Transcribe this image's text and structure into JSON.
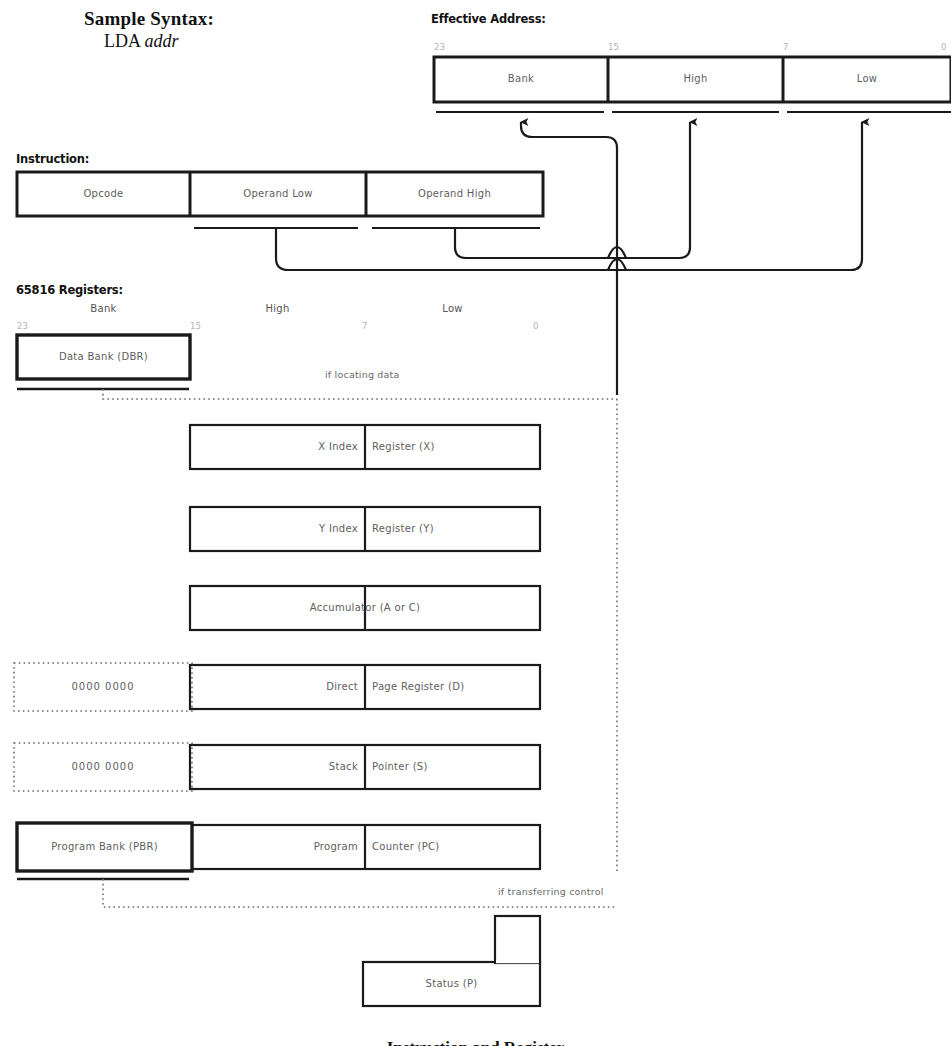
{
  "figure": {
    "caption": "Instruction and Register",
    "sample_syntax": {
      "heading": "Sample Syntax:",
      "mnemonic": "LDA",
      "operand": "addr"
    },
    "effective_address": {
      "heading": "Effective Address:",
      "cells": [
        {
          "label": "Bank"
        },
        {
          "label": "High"
        },
        {
          "label": "Low"
        }
      ],
      "bits": [
        "23",
        "15",
        "7",
        "0"
      ]
    },
    "instruction": {
      "heading": "Instruction:",
      "cells": [
        {
          "label": "Opcode"
        },
        {
          "label": "Operand Low"
        },
        {
          "label": "Operand High"
        }
      ]
    },
    "registers": {
      "heading": "65816 Registers:",
      "column_headers": [
        "Bank",
        "High",
        "Low"
      ],
      "bits": [
        "23",
        "15",
        "7",
        "0"
      ],
      "rows": [
        {
          "name": "data-bank",
          "left_label": "Data Bank (DBR)",
          "right_label": "",
          "prefix": ""
        },
        {
          "name": "x-index",
          "left_label": "X Index",
          "right_label": "Register (X)",
          "prefix": ""
        },
        {
          "name": "y-index",
          "left_label": "Y Index",
          "right_label": "Register (Y)",
          "prefix": ""
        },
        {
          "name": "accumulator",
          "left_label": "Accumulator (A or C)",
          "right_label": "",
          "prefix": ""
        },
        {
          "name": "direct-page",
          "left_label": "Direct",
          "right_label": "Page Register (D)",
          "prefix": "0000 0000"
        },
        {
          "name": "stack-pointer",
          "left_label": "Stack",
          "right_label": "Pointer (S)",
          "prefix": "0000 0000"
        },
        {
          "name": "program-counter",
          "left_label": "Program Bank (PBR)",
          "right_label": "Program",
          "extra_label": "Counter (PC)",
          "prefix": ""
        },
        {
          "name": "status",
          "left_label": "Status (P)",
          "right_label": "",
          "prefix": ""
        }
      ]
    },
    "annotations": [
      {
        "name": "if-locating-data",
        "text": "if locating data"
      },
      {
        "name": "if-transferring-control",
        "text": "if transferring control"
      }
    ],
    "colors": {
      "ink": "#1a1a1a",
      "label_grey": "#5e5e5e",
      "bit_grey": "#b3b3b3",
      "paper": "#ffffff"
    }
  }
}
